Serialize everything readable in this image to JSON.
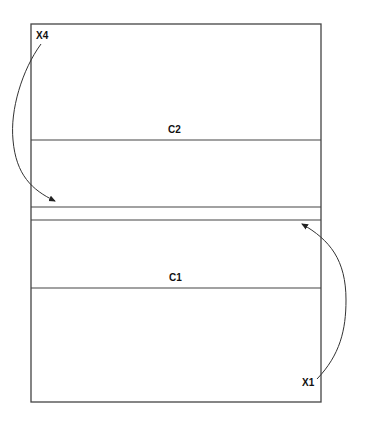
{
  "diagram": {
    "labels": {
      "top_left": "X4",
      "upper_section": "C2",
      "lower_section": "C1",
      "bottom_right": "X1"
    },
    "stroke_color": "#444444"
  }
}
